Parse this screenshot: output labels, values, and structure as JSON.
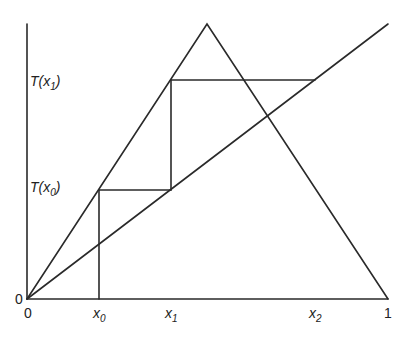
{
  "diagram": {
    "colors": {
      "line": "#2a2a2a",
      "text": "#222222",
      "background": "#ffffff"
    },
    "axes": {
      "origin_y_label": "0",
      "origin_x_label": "0",
      "x_end_label": "1"
    },
    "x_labels": [
      {
        "base": "x",
        "sub": "0"
      },
      {
        "base": "x",
        "sub": "1"
      },
      {
        "base": "x",
        "sub": "2"
      }
    ],
    "y_labels": [
      {
        "prefix": "T(x",
        "sub": "1",
        "suffix": ")"
      },
      {
        "prefix": "T(x",
        "sub": "0",
        "suffix": ")"
      }
    ],
    "curves": [
      "tent-map",
      "identity-diagonal"
    ],
    "cobweb_steps": [
      "x0 -> T(x0)",
      "T(x0) -> x1",
      "x1 -> T(x1)",
      "T(x1) -> x2"
    ]
  }
}
